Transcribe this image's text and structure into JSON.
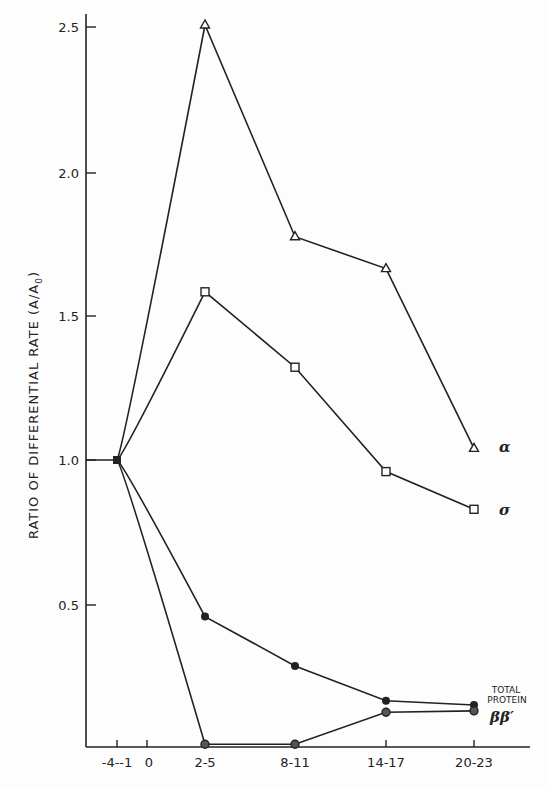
{
  "chart_data": {
    "type": "line",
    "title": "",
    "xlabel": "",
    "ylabel": "RATIO OF DIFFERENTIAL RATE (A/A0)",
    "ylabel_main": "RATIO OF DIFFERENTIAL RATE (A/A",
    "ylabel_sub": "0",
    "ylabel_close": ")",
    "ylim": [
      0,
      2.5
    ],
    "grid": false,
    "legend_position": "inline-right",
    "categories": [
      "-4--1",
      "2-5",
      "8-11",
      "14-17",
      "20-23"
    ],
    "x_tick_labels": [
      "-4--1",
      "0",
      "2-5",
      "8-11",
      "14-17",
      "20-23"
    ],
    "y_tick_labels": [
      "0.5",
      "1.0",
      "1.5",
      "2.0",
      "2.5"
    ],
    "y_ticks": [
      0.5,
      1.0,
      1.5,
      2.0,
      2.5
    ],
    "series": [
      {
        "name": "α",
        "marker": "open-triangle",
        "values": [
          1.0,
          2.5,
          1.77,
          1.66,
          1.04
        ]
      },
      {
        "name": "σ",
        "marker": "open-square",
        "values": [
          1.0,
          1.58,
          1.32,
          0.96,
          0.83
        ]
      },
      {
        "name": "TOTAL PROTEIN",
        "marker": "filled-circle",
        "values": [
          1.0,
          0.46,
          0.29,
          0.17,
          0.155
        ]
      },
      {
        "name": "ββ′",
        "marker": "half-filled-circle",
        "values": [
          1.0,
          0.02,
          0.02,
          0.13,
          0.135
        ]
      }
    ],
    "annotations": [
      "α",
      "σ",
      "TOTAL",
      "PROTEIN",
      "ββ′"
    ]
  },
  "labels": {
    "alpha": "α",
    "sigma": "σ",
    "total": "TOTAL",
    "protein": "PROTEIN",
    "betabeta": "ββ′"
  }
}
